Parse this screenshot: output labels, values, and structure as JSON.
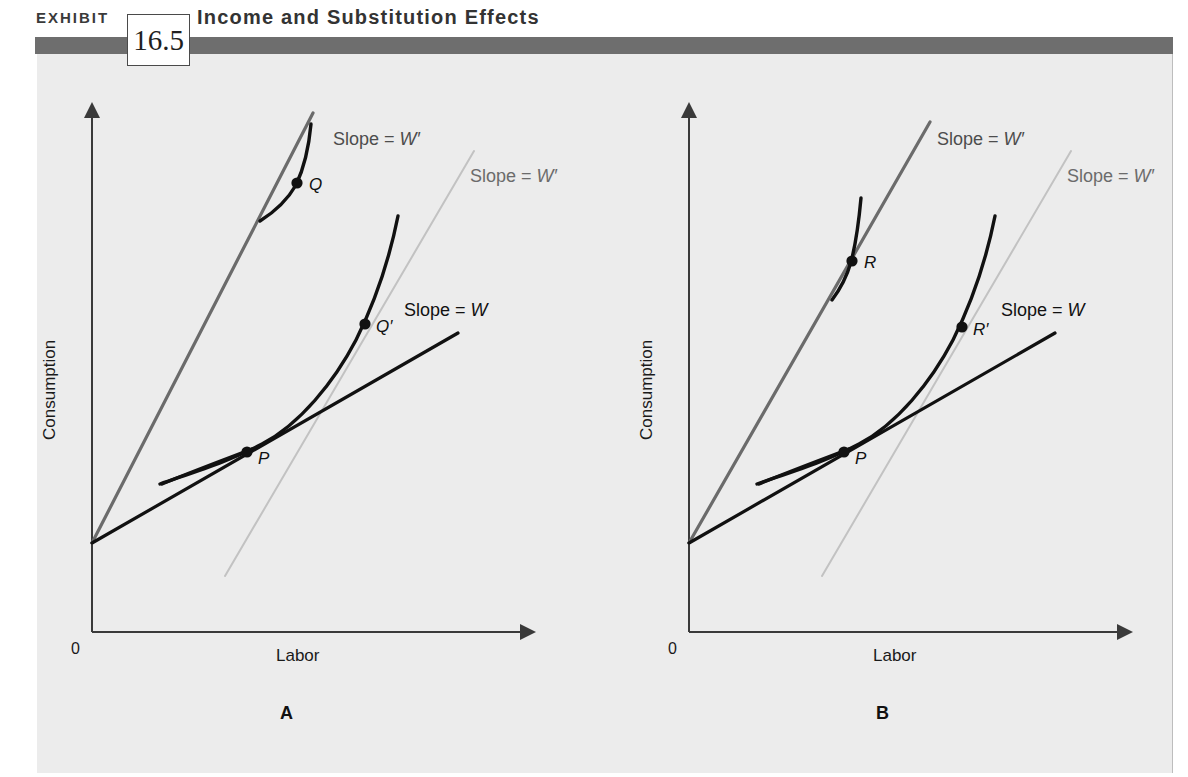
{
  "header": {
    "exhibit_label": "EXHIBIT",
    "exhibit_number": "16.5",
    "title": "Income and Substitution Effects",
    "bar_color": "#6e6e6e",
    "panel_bg": "#ececec"
  },
  "panels": [
    {
      "id": "A",
      "letter": "A",
      "axes": {
        "y_label": "Consumption",
        "x_label": "Labor",
        "origin_label": "0"
      },
      "lines": [
        {
          "name": "budget-line-w-prime-steep",
          "label": "Slope = W′",
          "color": "#6b6b6b"
        },
        {
          "name": "budget-line-w-prime-shifted",
          "label": "Slope = W′",
          "color": "#c2c2c2"
        },
        {
          "name": "budget-line-w",
          "label": "Slope = W",
          "color": "#111111"
        }
      ],
      "points": [
        {
          "name": "point-q",
          "label": "Q"
        },
        {
          "name": "point-q-prime",
          "label": "Q′"
        },
        {
          "name": "point-p",
          "label": "P"
        }
      ]
    },
    {
      "id": "B",
      "letter": "B",
      "axes": {
        "y_label": "Consumption",
        "x_label": "Labor",
        "origin_label": "0"
      },
      "lines": [
        {
          "name": "budget-line-w-prime-steep",
          "label": "Slope = W′",
          "color": "#6b6b6b"
        },
        {
          "name": "budget-line-w-prime-shifted",
          "label": "Slope = W′",
          "color": "#c2c2c2"
        },
        {
          "name": "budget-line-w",
          "label": "Slope = W",
          "color": "#111111"
        }
      ],
      "points": [
        {
          "name": "point-r",
          "label": "R"
        },
        {
          "name": "point-r-prime",
          "label": "R′"
        },
        {
          "name": "point-p",
          "label": "P"
        }
      ]
    }
  ],
  "chart_data": {
    "type": "line",
    "title": "Income and Substitution Effects",
    "subtitle": "",
    "xlabel": "Labor",
    "ylabel": "Consumption",
    "grid": false,
    "legend": "none",
    "panels": [
      {
        "panel": "A",
        "description": "Substitution effect dominates: wage rise from W to W' moves optimum from P to Q; the compensated point Q' lies to the right of P.",
        "series": [
          {
            "name": "Slope = W (original budget line)",
            "color": "#111111",
            "from": [
              0,
              0.18
            ],
            "to": [
              0.8,
              0.55
            ]
          },
          {
            "name": "Slope = W' (new budget line)",
            "color": "#6b6b6b",
            "from": [
              0,
              0.18
            ],
            "to": [
              0.48,
              1.0
            ]
          },
          {
            "name": "Slope = W' (compensated budget line)",
            "color": "#c2c2c2",
            "from": [
              0.28,
              0.1
            ],
            "to": [
              0.72,
              0.9
            ]
          },
          {
            "name": "Indifference curve through P and Q'",
            "color": "#111111",
            "type": "curve"
          },
          {
            "name": "Higher indifference curve through Q",
            "color": "#111111",
            "type": "curve"
          }
        ],
        "points": [
          {
            "label": "P",
            "x": 0.36,
            "y": 0.34
          },
          {
            "label": "Q",
            "x": 0.46,
            "y": 0.84
          },
          {
            "label": "Q′",
            "x": 0.62,
            "y": 0.58
          }
        ]
      },
      {
        "panel": "B",
        "description": "Income effect dominates: wage rise from W to W' moves optimum from P to R, which lies to the left of the compensated point R'.",
        "series": [
          {
            "name": "Slope = W (original budget line)",
            "color": "#111111",
            "from": [
              0,
              0.18
            ],
            "to": [
              0.8,
              0.55
            ]
          },
          {
            "name": "Slope = W' (new budget line)",
            "color": "#6b6b6b",
            "from": [
              0,
              0.18
            ],
            "to": [
              0.48,
              1.0
            ]
          },
          {
            "name": "Slope = W' (compensated budget line)",
            "color": "#c2c2c2",
            "from": [
              0.28,
              0.1
            ],
            "to": [
              0.72,
              0.9
            ]
          },
          {
            "name": "Indifference curve through P and R'",
            "color": "#111111",
            "type": "curve"
          },
          {
            "name": "Higher indifference curve through R",
            "color": "#111111",
            "type": "curve"
          }
        ],
        "points": [
          {
            "label": "P",
            "x": 0.36,
            "y": 0.34
          },
          {
            "label": "R",
            "x": 0.37,
            "y": 0.7
          },
          {
            "label": "R′",
            "x": 0.62,
            "y": 0.58
          }
        ]
      }
    ]
  }
}
